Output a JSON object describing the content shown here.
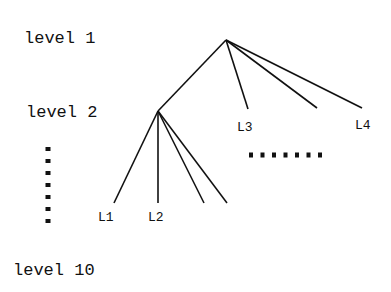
{
  "levels": [
    {
      "label": "level 1",
      "x": 24,
      "y": 43
    },
    {
      "label": "level 2",
      "x": 26,
      "y": 117
    },
    {
      "label": "level 10",
      "x": 13,
      "y": 275
    }
  ],
  "nodes": {
    "root": {
      "x": 226,
      "y": 40
    },
    "level2": {
      "x": 158,
      "y": 111
    }
  },
  "edges": [
    {
      "from": [
        226,
        40
      ],
      "to": [
        158,
        111
      ]
    },
    {
      "from": [
        226,
        40
      ],
      "to": [
        248,
        109
      ]
    },
    {
      "from": [
        226,
        40
      ],
      "to": [
        317,
        108
      ]
    },
    {
      "from": [
        226,
        40
      ],
      "to": [
        362,
        108
      ]
    },
    {
      "from": [
        158,
        111
      ],
      "to": [
        114,
        203
      ]
    },
    {
      "from": [
        158,
        111
      ],
      "to": [
        158,
        203
      ]
    },
    {
      "from": [
        158,
        111
      ],
      "to": [
        204,
        203
      ]
    },
    {
      "from": [
        158,
        111
      ],
      "to": [
        227,
        203
      ]
    }
  ],
  "leaves": [
    {
      "label": "L1",
      "x": 98,
      "y": 221
    },
    {
      "label": "L2",
      "x": 148,
      "y": 221
    },
    {
      "label": "L3",
      "x": 237,
      "y": 131
    },
    {
      "label": "L4",
      "x": 355,
      "y": 129
    }
  ],
  "ellipsis_vertical": {
    "x": 48,
    "y_start": 149,
    "step": 12,
    "count": 7
  },
  "ellipsis_horizontal": {
    "y": 155,
    "x_start": 251,
    "step": 11.5,
    "count": 7
  }
}
